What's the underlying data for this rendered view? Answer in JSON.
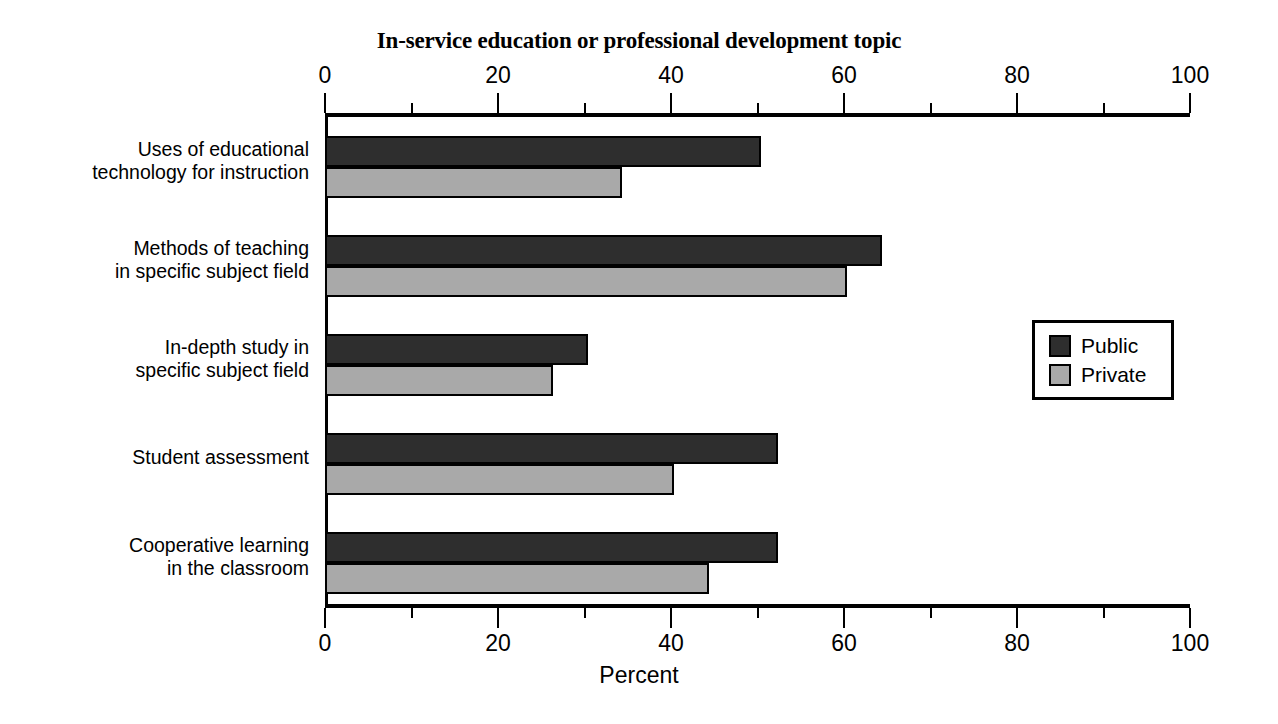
{
  "chart_data": {
    "type": "bar",
    "orientation": "horizontal",
    "title": "In-service education or professional development topic",
    "xlabel": "Percent",
    "ylabel": "",
    "xlim": [
      0,
      100
    ],
    "xticks": [
      0,
      20,
      40,
      60,
      80,
      100
    ],
    "xtick_labels": [
      "0",
      "20",
      "40",
      "60",
      "80",
      "100"
    ],
    "minor_tick_interval": 10,
    "grid": false,
    "dual_axis": true,
    "axis_note": "Tick labels repeated on top and bottom axes",
    "legend": {
      "position": "right-middle",
      "entries": [
        "Public",
        "Private"
      ]
    },
    "categories": [
      "Uses of educational technology for instruction",
      "Methods of teaching in specific subject field",
      "In-depth study in specific subject field",
      "Student assessment",
      "Cooperative learning in the classroom"
    ],
    "category_lines": [
      [
        "Uses of educational",
        "technology for instruction"
      ],
      [
        "Methods of teaching",
        "in specific subject field"
      ],
      [
        "In-depth study in",
        "specific subject field"
      ],
      [
        "Student assessment"
      ],
      [
        "Cooperative learning",
        "in the classroom"
      ]
    ],
    "series": [
      {
        "name": "Public",
        "color": "#2e2e2e",
        "values": [
          50,
          64,
          30,
          52,
          52
        ]
      },
      {
        "name": "Private",
        "color": "#a9a9a9",
        "values": [
          34,
          60,
          26,
          40,
          44
        ]
      }
    ]
  },
  "colors": {
    "public": "#2e2e2e",
    "private": "#a9a9a9",
    "axis": "#000000",
    "background": "#ffffff"
  }
}
